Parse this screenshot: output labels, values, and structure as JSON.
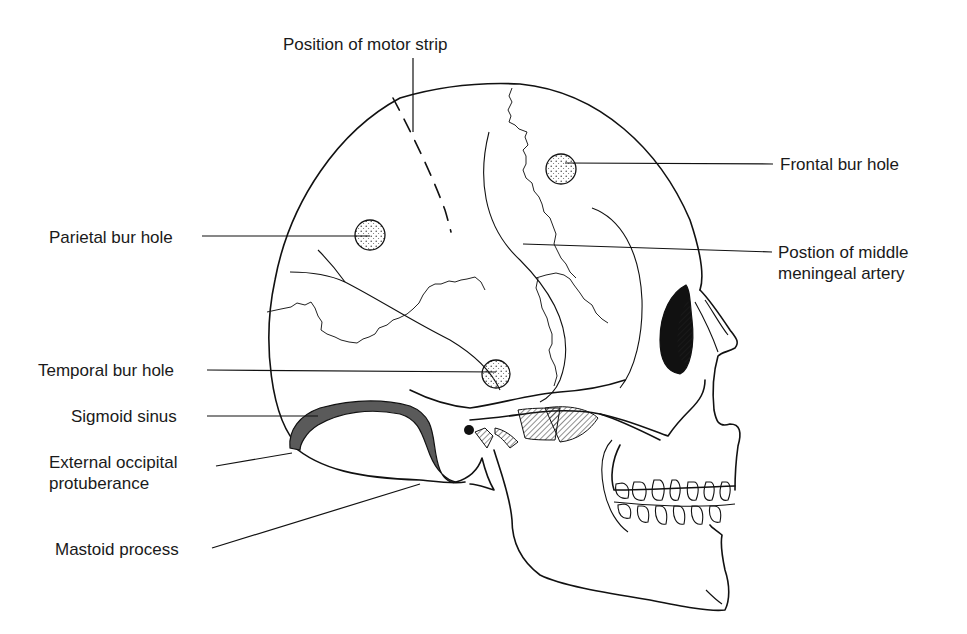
{
  "figure": {
    "colors": {
      "line": "#111111",
      "sinus_fill": "#5a5a5a",
      "bur_hole_fill": "#f4f4f4",
      "background": "#ffffff"
    }
  },
  "labels": {
    "motor_strip": "Position of motor strip",
    "frontal_bur_hole": "Frontal bur hole",
    "parietal_bur_hole": "Parietal bur hole",
    "middle_meningeal_line1": "Postion of middle",
    "middle_meningeal_line2": "meningeal artery",
    "temporal_bur_hole": "Temporal bur hole",
    "sigmoid_sinus": "Sigmoid sinus",
    "occipital_line1": "External occipital",
    "occipital_line2": "protuberance",
    "mastoid_process": "Mastoid process"
  },
  "bur_holes": [
    {
      "name": "frontal",
      "cx": 561,
      "cy": 169,
      "r": 15
    },
    {
      "name": "parietal",
      "cx": 370,
      "cy": 235,
      "r": 15
    },
    {
      "name": "temporal",
      "cx": 496,
      "cy": 374,
      "r": 14
    }
  ]
}
